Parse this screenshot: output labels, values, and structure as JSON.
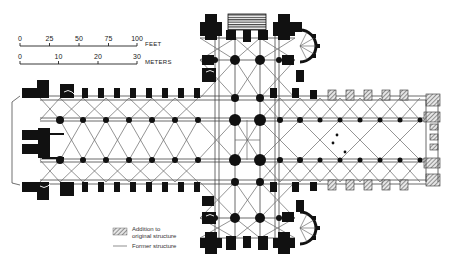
{
  "figure": {
    "type": "cathedral floor plan",
    "orientation": "horizontal, west facade at left, apse/chevet at right"
  },
  "scale_bars": {
    "feet": {
      "unit_label": "FEET",
      "ticks": [
        "0",
        "25",
        "50",
        "75",
        "100"
      ]
    },
    "meters": {
      "unit_label": "METERS",
      "ticks": [
        "0",
        "10",
        "20",
        "30"
      ]
    }
  },
  "legend": {
    "items": [
      {
        "symbol": "hatched-square",
        "label_line1": "Addition to",
        "label_line2": "original structure"
      },
      {
        "symbol": "thin-line",
        "label_line1": "Former structure"
      }
    ]
  },
  "colors": {
    "wall": "#111111",
    "vault_lines": "#555555",
    "addition_hatch": "#777777",
    "background": "#ffffff"
  }
}
